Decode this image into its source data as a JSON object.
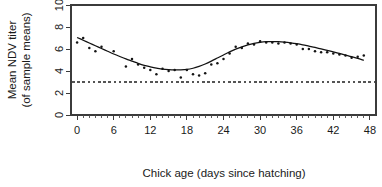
{
  "chart_data": {
    "type": "scatter",
    "title": "",
    "xlabel": "Chick age (days since hatching)",
    "ylabel_line1": "Mean NDV titer",
    "ylabel_line2": "(of sample means)",
    "xlim": [
      -1,
      49
    ],
    "ylim": [
      0,
      10
    ],
    "grid": false,
    "legend": null,
    "xticks": [
      0,
      6,
      12,
      18,
      24,
      30,
      36,
      42,
      48
    ],
    "xtick_labels": [
      "0",
      "6",
      "12",
      "18",
      "24",
      "30",
      "36",
      "42",
      "48"
    ],
    "xminor_step": 1,
    "yticks": [
      0,
      2,
      4,
      6,
      8,
      10
    ],
    "ytick_labels": [
      "0",
      "2",
      "4",
      "6",
      "8",
      "10"
    ],
    "reference_line": {
      "orientation": "horizontal",
      "value": 3,
      "style": "dashed",
      "color": "#555555"
    },
    "series": [
      {
        "name": "Mean NDV titer (sample means)",
        "type": "scatter",
        "marker": "dot",
        "color": "#141414",
        "points": [
          [
            0,
            6.6
          ],
          [
            1,
            7.0
          ],
          [
            2,
            6.1
          ],
          [
            3,
            5.8
          ],
          [
            4,
            6.2
          ],
          [
            6,
            5.8
          ],
          [
            8,
            4.4
          ],
          [
            9,
            5.1
          ],
          [
            10,
            4.6
          ],
          [
            11,
            4.3
          ],
          [
            12,
            4.1
          ],
          [
            13,
            3.7
          ],
          [
            14,
            4.2
          ],
          [
            15,
            4.0
          ],
          [
            16,
            4.1
          ],
          [
            17,
            3.4
          ],
          [
            18,
            4.1
          ],
          [
            19,
            3.7
          ],
          [
            20,
            3.6
          ],
          [
            21,
            3.8
          ],
          [
            22,
            4.6
          ],
          [
            23,
            4.7
          ],
          [
            24,
            5.1
          ],
          [
            25,
            5.6
          ],
          [
            26,
            6.2
          ],
          [
            27,
            6.1
          ],
          [
            28,
            6.5
          ],
          [
            29,
            6.4
          ],
          [
            30,
            6.7
          ],
          [
            31,
            6.6
          ],
          [
            32,
            6.6
          ],
          [
            33,
            6.5
          ],
          [
            34,
            6.6
          ],
          [
            35,
            6.5
          ],
          [
            36,
            6.4
          ],
          [
            37,
            6.0
          ],
          [
            38,
            6.0
          ],
          [
            39,
            5.8
          ],
          [
            40,
            5.7
          ],
          [
            41,
            5.7
          ],
          [
            42,
            5.6
          ],
          [
            43,
            5.5
          ],
          [
            44,
            5.4
          ],
          [
            45,
            5.2
          ],
          [
            46,
            5.3
          ],
          [
            47,
            5.4
          ]
        ]
      },
      {
        "name": "smoothed fit",
        "type": "line",
        "color": "#111111",
        "points": [
          [
            0,
            7.05
          ],
          [
            1,
            6.8
          ],
          [
            2,
            6.55
          ],
          [
            3,
            6.3
          ],
          [
            4,
            6.05
          ],
          [
            5,
            5.8
          ],
          [
            6,
            5.55
          ],
          [
            7,
            5.32
          ],
          [
            8,
            5.1
          ],
          [
            9,
            4.9
          ],
          [
            10,
            4.7
          ],
          [
            11,
            4.52
          ],
          [
            12,
            4.38
          ],
          [
            13,
            4.26
          ],
          [
            14,
            4.18
          ],
          [
            15,
            4.13
          ],
          [
            16,
            4.1
          ],
          [
            17,
            4.1
          ],
          [
            18,
            4.14
          ],
          [
            19,
            4.25
          ],
          [
            20,
            4.42
          ],
          [
            21,
            4.64
          ],
          [
            22,
            4.9
          ],
          [
            23,
            5.18
          ],
          [
            24,
            5.46
          ],
          [
            25,
            5.74
          ],
          [
            26,
            5.99
          ],
          [
            27,
            6.2
          ],
          [
            28,
            6.38
          ],
          [
            29,
            6.52
          ],
          [
            30,
            6.61
          ],
          [
            31,
            6.66
          ],
          [
            32,
            6.67
          ],
          [
            33,
            6.66
          ],
          [
            34,
            6.62
          ],
          [
            35,
            6.56
          ],
          [
            36,
            6.48
          ],
          [
            37,
            6.38
          ],
          [
            38,
            6.26
          ],
          [
            39,
            6.14
          ],
          [
            40,
            6.01
          ],
          [
            41,
            5.88
          ],
          [
            42,
            5.74
          ],
          [
            43,
            5.6
          ],
          [
            44,
            5.45
          ],
          [
            45,
            5.3
          ],
          [
            46,
            5.14
          ],
          [
            47,
            4.97
          ]
        ]
      }
    ]
  }
}
